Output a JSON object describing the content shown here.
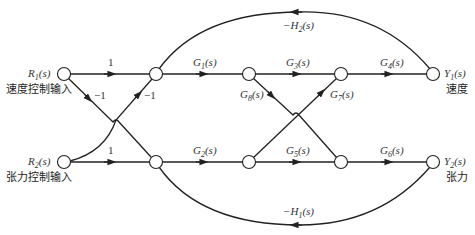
{
  "diagram": {
    "type": "signal-flow-graph",
    "colors": {
      "line": "#222222",
      "node_fill": "#ffffff",
      "text": "#333333"
    },
    "nodes": [
      {
        "id": "R1",
        "label": "R1(s)",
        "sublabel": "速度控制输入"
      },
      {
        "id": "n1"
      },
      {
        "id": "n2"
      },
      {
        "id": "n3"
      },
      {
        "id": "Y1",
        "label": "Y1(s)",
        "sublabel": "速度"
      },
      {
        "id": "R2",
        "label": "R2(s)",
        "sublabel": "张力控制输入"
      },
      {
        "id": "m1"
      },
      {
        "id": "m2"
      },
      {
        "id": "m3"
      },
      {
        "id": "Y2",
        "label": "Y2(s)",
        "sublabel": "张力"
      }
    ],
    "edges": [
      {
        "from": "R1",
        "to": "n1",
        "gain": "1"
      },
      {
        "from": "R1",
        "to": "m1",
        "gain": "-1"
      },
      {
        "from": "R2",
        "to": "n1",
        "gain": "-1"
      },
      {
        "from": "R2",
        "to": "m1",
        "gain": "1"
      },
      {
        "from": "n1",
        "to": "n2",
        "gain": "G1(s)"
      },
      {
        "from": "n2",
        "to": "n3",
        "gain": "G3(s)"
      },
      {
        "from": "n3",
        "to": "Y1",
        "gain": "G4(s)"
      },
      {
        "from": "m1",
        "to": "m2",
        "gain": "G2(s)"
      },
      {
        "from": "m2",
        "to": "m3",
        "gain": "G5(s)"
      },
      {
        "from": "m3",
        "to": "Y2",
        "gain": "G6(s)"
      },
      {
        "from": "n2",
        "to": "m3",
        "gain": "G8(s)"
      },
      {
        "from": "m2",
        "to": "n3",
        "gain": "G7(s)"
      },
      {
        "from": "Y1",
        "to": "n1",
        "gain": "-H2(s)"
      },
      {
        "from": "Y2",
        "to": "m1",
        "gain": "-H1(s)"
      }
    ],
    "labels": {
      "r1_main": "R",
      "r1_sub": "1",
      "r1_tail": "(s)",
      "r1_cn": "速度控制输入",
      "r2_main": "R",
      "r2_sub": "2",
      "r2_tail": "(s)",
      "r2_cn": "张力控制输入",
      "y1_main": "Y",
      "y1_sub": "1",
      "y1_tail": "(s)",
      "y1_cn": "速度",
      "y2_main": "Y",
      "y2_sub": "2",
      "y2_tail": "(s)",
      "y2_cn": "张力",
      "g1": [
        "G",
        "1",
        "(s)"
      ],
      "g2": [
        "G",
        "2",
        "(s)"
      ],
      "g3": [
        "G",
        "3",
        "(s)"
      ],
      "g4": [
        "G",
        "4",
        "(s)"
      ],
      "g5": [
        "G",
        "5",
        "(s)"
      ],
      "g6": [
        "G",
        "6",
        "(s)"
      ],
      "g7": [
        "G",
        "7",
        "(s)"
      ],
      "g8": [
        "G",
        "8",
        "(s)"
      ],
      "h1": [
        "−H",
        "1",
        "(s)"
      ],
      "h2": [
        "−H",
        "2",
        "(s)"
      ],
      "one_top": "1",
      "one_bottom": "1",
      "neg_one_left": "−1",
      "neg_one_right": "−1"
    }
  }
}
